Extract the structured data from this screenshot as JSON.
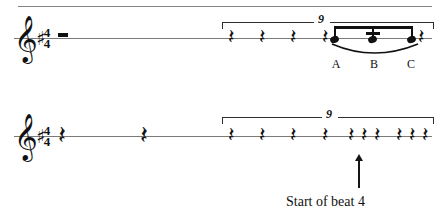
{
  "document": {
    "kind": "music-notation-figure",
    "width": 441,
    "height": 221,
    "ink_color": "#111111",
    "staff_line_color": "#7a7a7a"
  },
  "systems": [
    {
      "id": "system-1",
      "clef": "treble-clef",
      "clef_glyph": "𝄞",
      "key_signature": "♯",
      "time_signature": {
        "numerator": "4",
        "denominator": "4"
      },
      "rests": [
        {
          "name": "half-rest",
          "type": "half",
          "glyph": ""
        },
        {
          "name": "eighth-rest-1",
          "type": "eighth",
          "glyph": "𝄽"
        },
        {
          "name": "eighth-rest-2",
          "type": "eighth",
          "glyph": "𝄽"
        },
        {
          "name": "eighth-rest-3",
          "type": "eighth",
          "glyph": "𝄽"
        },
        {
          "name": "eighth-rest-4",
          "type": "eighth",
          "glyph": "𝄽"
        },
        {
          "name": "eighth-rest-5",
          "type": "eighth",
          "glyph": "𝄽"
        }
      ],
      "tuplet": {
        "number": "9"
      },
      "beamed_notes": [
        {
          "label": "A"
        },
        {
          "label": "B"
        },
        {
          "label": "C"
        }
      ],
      "articulation": "slur"
    },
    {
      "id": "system-2",
      "clef": "treble-clef",
      "clef_glyph": "𝄞",
      "key_signature": "♯",
      "time_signature": {
        "numerator": "4",
        "denominator": "4"
      },
      "rests": [
        {
          "name": "quarter-rest-1",
          "type": "quarter",
          "glyph": "𝄽"
        },
        {
          "name": "quarter-rest-2",
          "type": "quarter",
          "glyph": "𝄽"
        },
        {
          "name": "eighth-rest-1",
          "type": "eighth",
          "glyph": "𝄽"
        },
        {
          "name": "eighth-rest-2",
          "type": "eighth",
          "glyph": "𝄽"
        },
        {
          "name": "eighth-rest-3",
          "type": "eighth",
          "glyph": "𝄽"
        },
        {
          "name": "eighth-rest-4",
          "type": "eighth",
          "glyph": "𝄽"
        },
        {
          "name": "eighth-rest-5",
          "type": "eighth",
          "glyph": "𝄽"
        },
        {
          "name": "eighth-rest-6",
          "type": "eighth",
          "glyph": "𝄽"
        },
        {
          "name": "eighth-rest-7",
          "type": "eighth",
          "glyph": "𝄽"
        },
        {
          "name": "eighth-rest-8",
          "type": "eighth",
          "glyph": "𝄽"
        },
        {
          "name": "eighth-rest-9",
          "type": "eighth",
          "glyph": "𝄽"
        },
        {
          "name": "eighth-rest-10",
          "type": "eighth",
          "glyph": "𝄽"
        }
      ],
      "tuplet": {
        "number": "9"
      }
    }
  ],
  "annotation": {
    "caption": "Start of beat 4",
    "arrow": "up-arrow"
  }
}
